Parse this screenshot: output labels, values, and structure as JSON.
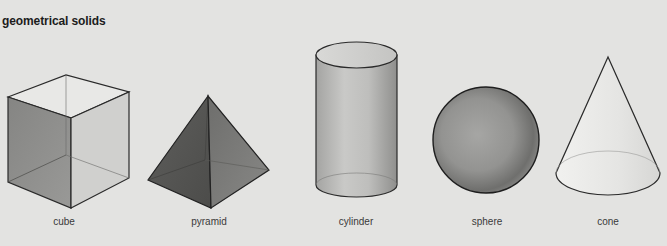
{
  "title": "geometrical solids",
  "solids": [
    {
      "name": "cube",
      "label": "cube",
      "label_x": 64
    },
    {
      "name": "pyramid",
      "label": "pyramid",
      "label_x": 209
    },
    {
      "name": "cylinder",
      "label": "cylinder",
      "label_x": 356
    },
    {
      "name": "sphere",
      "label": "sphere",
      "label_x": 487
    },
    {
      "name": "cone",
      "label": "cone",
      "label_x": 608
    }
  ],
  "colors": {
    "background": "#e3e3e1",
    "outline": "#2a2a2a",
    "cube_left_face": "#8d8d8b",
    "cube_right_face": "#d2d2d0",
    "cube_top_face": "#e6e6e4",
    "pyramid_left_face": "#5a5a58",
    "pyramid_right_face": "#7a7a78",
    "cylinder_body": "#b5b5b3",
    "sphere_body": "#8a8a88",
    "cone_body": "#ececea"
  }
}
